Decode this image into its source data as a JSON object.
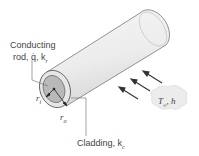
{
  "diagram": {
    "labels": {
      "rod_line1": "Conducting",
      "rod_line2": "rod, q̇, k",
      "rod_sub": "r",
      "cladding": "Cladding, k",
      "cladding_sub": "c",
      "ri": "r",
      "ri_sub": "i",
      "ro": "r",
      "ro_sub": "o",
      "fluid": "T",
      "fluid_sub": "∞",
      "fluid_h": ", h"
    },
    "colors": {
      "cylinder_fill": "#efefef",
      "cladding_fill": "#e4e4e4",
      "rod_fill": "#b8b8b8",
      "outline": "#555555",
      "cloud_fill": "#ececec",
      "arrow": "#333333"
    }
  }
}
